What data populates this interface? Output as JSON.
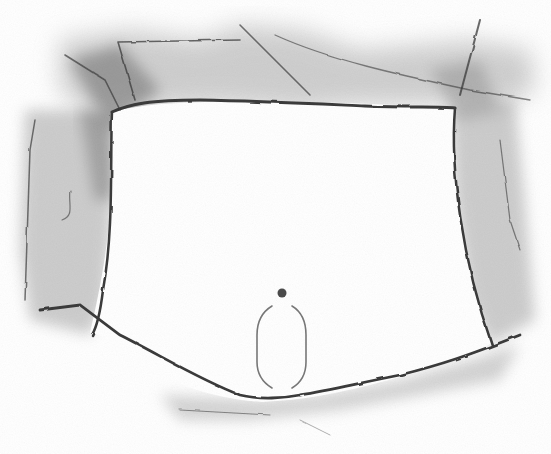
{
  "illustration": {
    "style": "pencil sketch, grayscale",
    "subject": "abdominal opening with surrounding tissue, navel and oval outline",
    "colors": {
      "background": "#ffffff",
      "shading_dark": "#6a6a6a",
      "shading_light": "#b9b9b9",
      "outline": "#3a3a3a",
      "oval_outline": "#777777",
      "navel": "#4a4a4a"
    },
    "parts": [
      {
        "id": "left-tissue",
        "label": "left tissue flap"
      },
      {
        "id": "right-tissue",
        "label": "right tissue flap"
      },
      {
        "id": "top-tissue",
        "label": "upper tissue band"
      },
      {
        "id": "bottom-tissue",
        "label": "lower tissue edge"
      },
      {
        "id": "opening",
        "label": "central opening"
      },
      {
        "id": "navel",
        "label": "navel"
      },
      {
        "id": "oval-outline",
        "label": "oval outline"
      }
    ]
  }
}
